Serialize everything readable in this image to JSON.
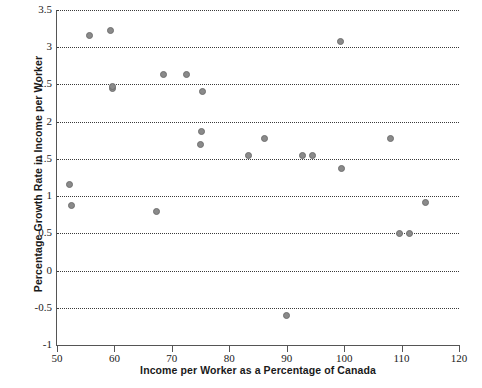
{
  "chart_data": {
    "type": "scatter",
    "title": "",
    "xlabel": "Income per Worker as a Percentage of Canada",
    "ylabel": "Percentage Growth Rate in Income per Worker",
    "xlim": [
      50,
      120
    ],
    "ylim": [
      -1,
      3.5
    ],
    "xticks": [
      50,
      60,
      70,
      80,
      90,
      100,
      110,
      120
    ],
    "yticks": [
      -1,
      -0.5,
      0,
      0.5,
      1,
      1.5,
      2,
      2.5,
      3,
      3.5
    ],
    "xtick_labels": [
      "50",
      "60",
      "70",
      "80",
      "90",
      "100",
      "110",
      "120"
    ],
    "ytick_labels": [
      "-1",
      "-0.5",
      "0",
      "0.5",
      "1",
      "1.5",
      "2",
      "2.5",
      "3",
      "3.5"
    ],
    "grid": true,
    "grid_axis": "y",
    "grid_style": "dotted",
    "legend": false,
    "marker_color": "#8a8a8a",
    "marker_edge_color": "#6f6f6f",
    "axis_color": "#555555",
    "points": [
      {
        "x": 52.1,
        "y": 1.15
      },
      {
        "x": 52.6,
        "y": 0.87
      },
      {
        "x": 55.6,
        "y": 3.16
      },
      {
        "x": 59.4,
        "y": 3.22
      },
      {
        "x": 59.6,
        "y": 2.45
      },
      {
        "x": 59.7,
        "y": 2.47
      },
      {
        "x": 67.4,
        "y": 0.8
      },
      {
        "x": 68.5,
        "y": 2.63
      },
      {
        "x": 72.6,
        "y": 2.63
      },
      {
        "x": 75.3,
        "y": 2.41
      },
      {
        "x": 75.1,
        "y": 1.87
      },
      {
        "x": 75.0,
        "y": 1.69
      },
      {
        "x": 83.3,
        "y": 1.55
      },
      {
        "x": 86.2,
        "y": 1.78
      },
      {
        "x": 90.0,
        "y": -0.61
      },
      {
        "x": 92.8,
        "y": 1.55
      },
      {
        "x": 94.5,
        "y": 1.55
      },
      {
        "x": 99.3,
        "y": 3.08
      },
      {
        "x": 99.6,
        "y": 1.37
      },
      {
        "x": 108.0,
        "y": 1.78
      },
      {
        "x": 109.7,
        "y": 0.5
      },
      {
        "x": 111.3,
        "y": 0.5
      },
      {
        "x": 114.1,
        "y": 0.92
      }
    ]
  }
}
